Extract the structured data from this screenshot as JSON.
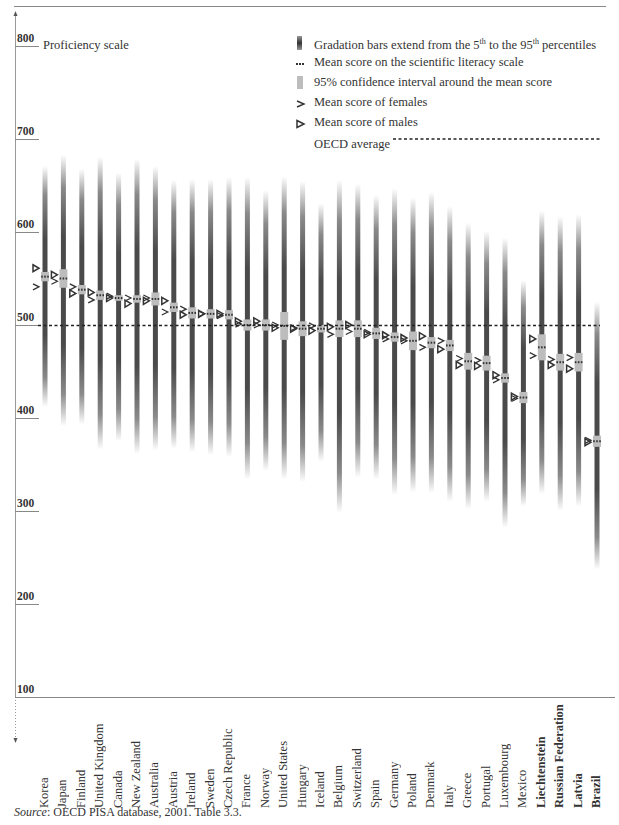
{
  "chart_data": {
    "type": "range-bar",
    "title": "",
    "ylabel": "Proficiency scale",
    "xlabel": "",
    "ylim": [
      100,
      800
    ],
    "yticks": [
      800,
      700,
      600,
      500,
      400,
      300,
      200,
      100
    ],
    "oecd_average": 500,
    "categories": [
      "Korea",
      "Japan",
      "Finland",
      "United Kingdom",
      "Canada",
      "New Zealand",
      "Australia",
      "Austria",
      "Ireland",
      "Sweden",
      "Czech Republic",
      "France",
      "Norway",
      "United States",
      "Hungary",
      "Iceland",
      "Belgium",
      "Switzerland",
      "Spain",
      "Germany",
      "Poland",
      "Denmark",
      "Italy",
      "Greece",
      "Portugal",
      "Luxembourg",
      "Mexico",
      "Liechtenstein",
      "Russian Federation",
      "Latvia",
      "Brazil"
    ],
    "bold_categories": [
      "Liechtenstein",
      "Russian Federation",
      "Latvia",
      "Brazil"
    ],
    "series": [
      {
        "name": "5th percentile",
        "values": [
          412,
          391,
          393,
          366,
          375,
          361,
          365,
          367,
          363,
          360,
          358,
          334,
          343,
          334,
          331,
          353,
          298,
          336,
          334,
          317,
          320,
          319,
          310,
          302,
          310,
          282,
          305,
          318,
          300,
          305,
          237
        ]
      },
      {
        "name": "95th percentile",
        "values": [
          671,
          683,
          668,
          681,
          664,
          679,
          671,
          656,
          657,
          657,
          659,
          659,
          645,
          660,
          655,
          631,
          656,
          652,
          640,
          647,
          637,
          643,
          628,
          610,
          601,
          594,
          548,
          623,
          617,
          619,
          525
        ]
      },
      {
        "name": "Mean score",
        "values": [
          552,
          550,
          538,
          532,
          529,
          528,
          528,
          519,
          513,
          512,
          511,
          500,
          500,
          499,
          496,
          496,
          496,
          496,
          491,
          487,
          483,
          481,
          478,
          461,
          459,
          443,
          422,
          476,
          460,
          460,
          375
        ]
      },
      {
        "name": "95% CI half-width",
        "values": [
          5,
          10,
          5,
          5,
          3,
          4,
          7,
          5,
          6,
          5,
          5,
          6,
          6,
          15,
          8,
          4,
          9,
          9,
          6,
          5,
          10,
          6,
          6,
          9,
          8,
          5,
          6,
          14,
          9,
          10,
          6
        ]
      },
      {
        "name": "Mean score of females",
        "values": [
          541,
          547,
          541,
          527,
          531,
          529,
          529,
          514,
          517,
          512,
          510,
          501,
          500,
          500,
          497,
          499,
          490,
          493,
          492,
          485,
          483,
          476,
          483,
          464,
          462,
          441,
          421,
          467,
          463,
          465,
          376
        ]
      },
      {
        "name": "Mean score of males",
        "values": [
          561,
          554,
          534,
          535,
          529,
          523,
          526,
          526,
          511,
          512,
          512,
          504,
          504,
          497,
          496,
          494,
          498,
          500,
          490,
          489,
          486,
          488,
          474,
          457,
          456,
          446,
          423,
          485,
          457,
          453,
          374
        ]
      }
    ],
    "legend": [
      "Gradation bars extend from the 5th to the 95th percentiles",
      "Mean score on the scientific literacy scale",
      "95% confidence interval around the mean score",
      "Mean score of females",
      "Mean score of males",
      "OECD average"
    ],
    "legend_position": "top-right",
    "grid": false
  },
  "axis": {
    "title": "Proficiency scale",
    "ticks": [
      "800",
      "700",
      "600",
      "500",
      "400",
      "300",
      "200",
      "100"
    ]
  },
  "legend": {
    "gradation_pre": "Gradation bars extend from the 5",
    "gradation_sup1": "th",
    "gradation_mid": " to the 95",
    "gradation_sup2": "th",
    "gradation_post": " percentiles",
    "mean": "Mean score on the scientific literacy scale",
    "ci": "95% confidence interval around the mean score",
    "females": "Mean score of females",
    "males": "Mean score of males",
    "oecd": "OECD average"
  },
  "source": {
    "label": "Source",
    "text": ": OECD PISA database, 2001. Table 3.3."
  },
  "colors": {
    "bar_dark": "#4a4a4a",
    "ci": "#bdbdbd",
    "marker": "#333333",
    "oecd_line": "#222222"
  }
}
